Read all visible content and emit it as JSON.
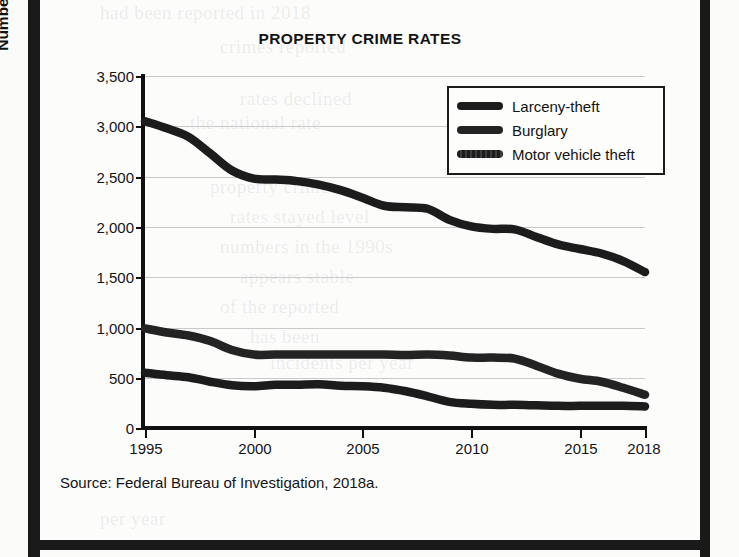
{
  "figure": {
    "title": "PROPERTY CRIME RATES",
    "source": "Source:  Federal Bureau of Investigation, 2018a."
  },
  "colors": {
    "ink": "#1a1a1a",
    "gridline": "#c9c9c9",
    "page": "#fcfcfb",
    "line_larceny": "#1c1c1c",
    "line_burglary": "#232323",
    "line_motor_vehicle": "#1c1c1c"
  },
  "legend": {
    "position": "top-right",
    "entries": [
      {
        "label": "Larceny-theft",
        "swatch": "solid-bar"
      },
      {
        "label": "Burglary",
        "swatch": "solid-bar"
      },
      {
        "label": "Motor vehicle theft",
        "swatch": "dotted-bar"
      }
    ]
  },
  "axes": {
    "y_title": "Number per 100,000 people",
    "y_ticks": [
      "0",
      "500",
      "1,000",
      "1,500",
      "2,000",
      "2,500",
      "3,000",
      "3,500"
    ],
    "x_ticks": [
      "1995",
      "2000",
      "2005",
      "2010",
      "2015",
      "2018"
    ]
  },
  "chart_data": {
    "type": "line",
    "title": "PROPERTY CRIME RATES",
    "xlabel": "",
    "ylabel": "Number per 100,000 people",
    "xlim": [
      1995,
      2018
    ],
    "ylim": [
      0,
      3500
    ],
    "y_ticks": [
      0,
      500,
      1000,
      1500,
      2000,
      2500,
      3000,
      3500
    ],
    "x_ticks": [
      1995,
      2000,
      2005,
      2010,
      2015,
      2018
    ],
    "grid": "horizontal",
    "legend_position": "top-right",
    "source": "Federal Bureau of Investigation, 2018a.",
    "x": [
      1995,
      1996,
      1997,
      1998,
      1999,
      2000,
      2001,
      2002,
      2003,
      2004,
      2005,
      2006,
      2007,
      2008,
      2009,
      2010,
      2011,
      2012,
      2013,
      2014,
      2015,
      2016,
      2017,
      2018
    ],
    "series": [
      {
        "name": "Larceny-theft",
        "values": [
          3050,
          2980,
          2895,
          2730,
          2560,
          2480,
          2470,
          2455,
          2420,
          2365,
          2290,
          2210,
          2195,
          2180,
          2070,
          2005,
          1980,
          1975,
          1900,
          1825,
          1780,
          1735,
          1660,
          1550
        ]
      },
      {
        "name": "Burglary",
        "values": [
          990,
          950,
          920,
          865,
          775,
          730,
          730,
          730,
          730,
          730,
          730,
          730,
          725,
          730,
          720,
          700,
          700,
          690,
          620,
          540,
          490,
          460,
          400,
          330
        ]
      },
      {
        "name": "Motor vehicle theft",
        "values": [
          550,
          525,
          505,
          460,
          425,
          415,
          430,
          430,
          435,
          420,
          415,
          400,
          365,
          315,
          260,
          240,
          230,
          230,
          225,
          220,
          220,
          220,
          220,
          215
        ]
      }
    ]
  }
}
